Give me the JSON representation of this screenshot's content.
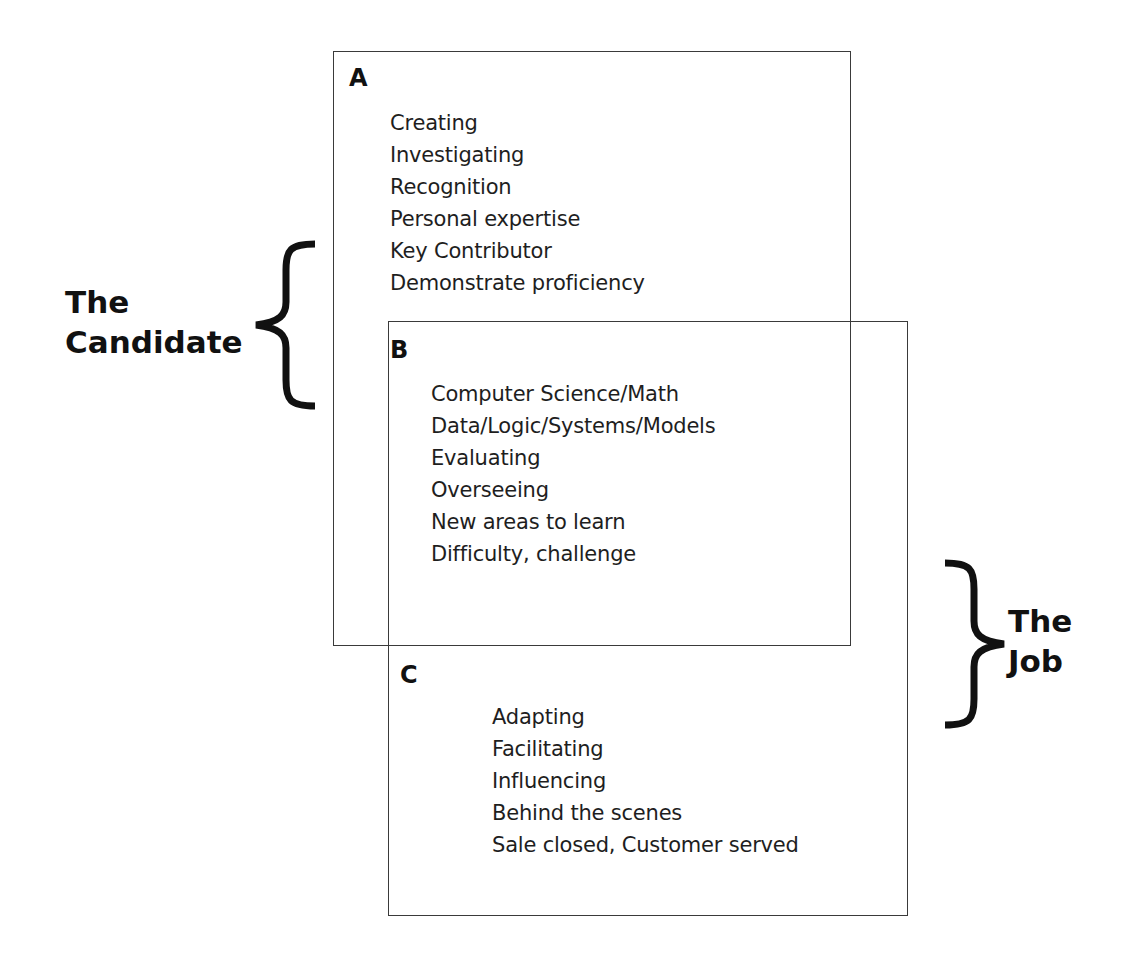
{
  "diagram": {
    "candidate_label": {
      "line1": "The",
      "line2": "Candidate"
    },
    "job_label": {
      "line1": "The",
      "line2": "Job"
    },
    "sections": {
      "A": {
        "letter": "A",
        "items": [
          "Creating",
          "Investigating",
          "Recognition",
          "Personal expertise",
          "Key Contributor",
          "Demonstrate proficiency"
        ]
      },
      "B": {
        "letter": "B",
        "items": [
          "Computer Science/Math",
          "Data/Logic/Systems/Models",
          "Evaluating",
          "Overseeing",
          "New areas to learn",
          "Difficulty, challenge"
        ]
      },
      "C": {
        "letter": "C",
        "items": [
          "Adapting",
          "Facilitating",
          "Influencing",
          "Behind the scenes",
          "Sale closed, Customer served"
        ]
      }
    },
    "colors": {
      "line": "#3a3a3a",
      "text": "#1e1e1e",
      "background": "#ffffff"
    }
  }
}
